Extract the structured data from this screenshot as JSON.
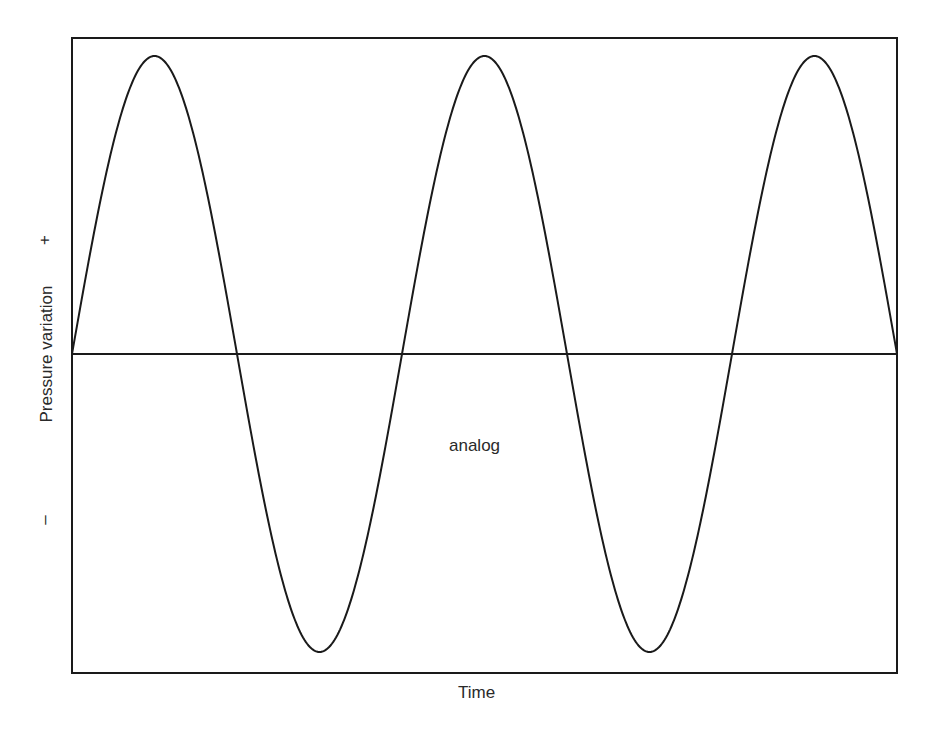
{
  "chart_data": {
    "type": "line",
    "title": "",
    "xlabel": "Time",
    "ylabel": "Pressure variation",
    "y_tick_labels": {
      "positive": "+",
      "negative": "–"
    },
    "annotation": "analog",
    "series": [
      {
        "name": "analog",
        "waveform": "sine",
        "cycles": 2.5,
        "amplitude": 1,
        "start_phase": 0
      }
    ],
    "x": [
      0,
      0.25,
      0.5,
      0.75,
      1.0,
      1.25,
      1.5,
      1.75,
      2.0,
      2.25,
      2.5
    ],
    "values": [
      0,
      1,
      0,
      -1,
      0,
      1,
      0,
      -1,
      0,
      1,
      0
    ],
    "ylim": [
      -1,
      1
    ],
    "grid": false,
    "legend": "none"
  }
}
